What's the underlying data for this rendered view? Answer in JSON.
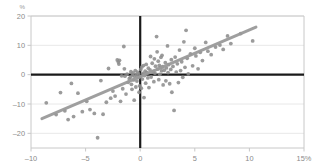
{
  "chart_data": {
    "type": "scatter",
    "title": "",
    "subtitle": "",
    "xlabel": "",
    "ylabel": "",
    "y_unit_label": "%",
    "x_unit_suffix": "%",
    "xlim": [
      -10,
      15
    ],
    "ylim": [
      -25,
      20
    ],
    "x_ticks": [
      -10,
      -5,
      0,
      5,
      10,
      15
    ],
    "x_tick_labels": [
      "–10",
      "–5",
      "0",
      "5",
      "10",
      "15%"
    ],
    "y_ticks": [
      20,
      10,
      0,
      -10,
      -20
    ],
    "y_tick_labels": [
      "20",
      "10",
      "0",
      "–10",
      "–20"
    ],
    "grid": {
      "horizontal": true,
      "vertical": false
    },
    "legend": {
      "visible": false,
      "position": "none"
    },
    "zero_lines": {
      "x": 0,
      "y": 0
    },
    "colors": {
      "point": "#8d8d8d",
      "trendline": "#9a9a9a",
      "zero_axis": "#1a1a1a",
      "gridline": "#e8e8e8",
      "frame": "#c8c8c8",
      "tick_label": "#8a8a8a",
      "background": "#ffffff"
    },
    "point_radius": 1.9,
    "trendline": {
      "type": "linear",
      "x_start": -9.0,
      "y_start": -15.0,
      "x_end": 10.6,
      "y_end": 16.2,
      "width": 3.0
    },
    "series": [
      {
        "name": "observations",
        "points": [
          [
            -8.6,
            -9.6
          ],
          [
            -7.7,
            -13.6
          ],
          [
            -7.3,
            -6.1
          ],
          [
            -6.9,
            -12.3
          ],
          [
            -6.6,
            -15.3
          ],
          [
            -6.3,
            -3.0
          ],
          [
            -6.1,
            -14.3
          ],
          [
            -5.7,
            -6.3
          ],
          [
            -5.3,
            -12.6
          ],
          [
            -4.9,
            -9.1
          ],
          [
            -4.6,
            -11.9
          ],
          [
            -4.2,
            -13.2
          ],
          [
            -3.9,
            -21.5
          ],
          [
            -3.6,
            -2.0
          ],
          [
            -3.4,
            -13.5
          ],
          [
            -3.1,
            -9.4
          ],
          [
            -2.9,
            2.1
          ],
          [
            -2.7,
            -8.0
          ],
          [
            -2.5,
            -5.6
          ],
          [
            -2.3,
            -7.3
          ],
          [
            -2.1,
            5.0
          ],
          [
            -2.0,
            4.3
          ],
          [
            -1.95,
            3.6
          ],
          [
            -1.9,
            4.9
          ],
          [
            -1.8,
            -9.1
          ],
          [
            -1.7,
            -0.4
          ],
          [
            -1.6,
            -4.8
          ],
          [
            -1.5,
            9.6
          ],
          [
            -1.45,
            2.0
          ],
          [
            -1.4,
            -0.5
          ],
          [
            -1.3,
            -6.6
          ],
          [
            -1.2,
            0.2
          ],
          [
            -1.1,
            -2.6
          ],
          [
            -1.0,
            -1.4
          ],
          [
            -0.9,
            -0.9
          ],
          [
            -0.85,
            1.0
          ],
          [
            -0.8,
            -3.3
          ],
          [
            -0.75,
            -5.0
          ],
          [
            -0.7,
            -0.2
          ],
          [
            -0.65,
            0.6
          ],
          [
            -0.6,
            -1.8
          ],
          [
            -0.55,
            -8.7
          ],
          [
            -0.5,
            -0.6
          ],
          [
            -0.45,
            1.4
          ],
          [
            -0.4,
            -4.2
          ],
          [
            -0.35,
            -0.1
          ],
          [
            -0.3,
            -2.2
          ],
          [
            -0.25,
            0.9
          ],
          [
            -0.2,
            -1.0
          ],
          [
            -0.15,
            0.3
          ],
          [
            -0.1,
            -6.0
          ],
          [
            -0.05,
            -3.8
          ],
          [
            0.0,
            -0.7
          ],
          [
            0.05,
            1.8
          ],
          [
            0.1,
            -4.6
          ],
          [
            0.15,
            2.6
          ],
          [
            0.2,
            -1.5
          ],
          [
            0.25,
            0.4
          ],
          [
            0.3,
            3.1
          ],
          [
            0.35,
            -7.8
          ],
          [
            0.4,
            -0.3
          ],
          [
            0.45,
            1.2
          ],
          [
            0.5,
            -2.9
          ],
          [
            0.55,
            3.5
          ],
          [
            0.6,
            0.8
          ],
          [
            0.7,
            -1.1
          ],
          [
            0.75,
            2.2
          ],
          [
            0.8,
            -4.4
          ],
          [
            0.9,
            1.6
          ],
          [
            0.95,
            6.2
          ],
          [
            1.0,
            -0.8
          ],
          [
            1.1,
            3.9
          ],
          [
            1.2,
            1.1
          ],
          [
            1.25,
            -2.4
          ],
          [
            1.3,
            5.4
          ],
          [
            1.35,
            0.5
          ],
          [
            1.4,
            2.9
          ],
          [
            1.5,
            13.0
          ],
          [
            1.55,
            7.8
          ],
          [
            1.6,
            1.9
          ],
          [
            1.65,
            4.6
          ],
          [
            1.7,
            -1.7
          ],
          [
            1.75,
            3.2
          ],
          [
            1.8,
            0.1
          ],
          [
            1.85,
            2.4
          ],
          [
            1.9,
            5.9
          ],
          [
            1.95,
            1.3
          ],
          [
            2.0,
            6.6
          ],
          [
            2.05,
            2.7
          ],
          [
            2.1,
            -3.5
          ],
          [
            2.2,
            1.5
          ],
          [
            2.3,
            4.1
          ],
          [
            2.35,
            -2.1
          ],
          [
            2.4,
            2.3
          ],
          [
            2.5,
            9.8
          ],
          [
            2.55,
            0.7
          ],
          [
            2.6,
            3.4
          ],
          [
            2.7,
            -3.1
          ],
          [
            2.8,
            1.8
          ],
          [
            2.85,
            5.1
          ],
          [
            2.9,
            -6.0
          ],
          [
            3.0,
            2.8
          ],
          [
            3.1,
            -12.2
          ],
          [
            3.2,
            6.0
          ],
          [
            3.3,
            0.9
          ],
          [
            3.4,
            3.7
          ],
          [
            3.5,
            -2.7
          ],
          [
            3.6,
            8.4
          ],
          [
            3.7,
            1.4
          ],
          [
            3.8,
            4.4
          ],
          [
            3.9,
            -0.9
          ],
          [
            4.0,
            11.2
          ],
          [
            4.1,
            2.5
          ],
          [
            4.2,
            15.1
          ],
          [
            4.3,
            5.6
          ],
          [
            4.4,
            0.3
          ],
          [
            4.6,
            7.1
          ],
          [
            4.8,
            3.0
          ],
          [
            5.0,
            9.0
          ],
          [
            5.1,
            6.4
          ],
          [
            5.3,
            2.0
          ],
          [
            5.5,
            7.6
          ],
          [
            5.7,
            4.8
          ],
          [
            6.0,
            11.0
          ],
          [
            6.2,
            8.0
          ],
          [
            6.5,
            6.8
          ],
          [
            6.9,
            9.4
          ],
          [
            7.3,
            10.1
          ],
          [
            7.6,
            8.6
          ],
          [
            8.0,
            13.2
          ],
          [
            8.3,
            10.6
          ],
          [
            9.2,
            14.0
          ],
          [
            10.3,
            11.5
          ]
        ]
      }
    ]
  },
  "layout": {
    "plot_left": 31,
    "plot_right": 304,
    "plot_top": 16,
    "plot_bottom": 148
  }
}
